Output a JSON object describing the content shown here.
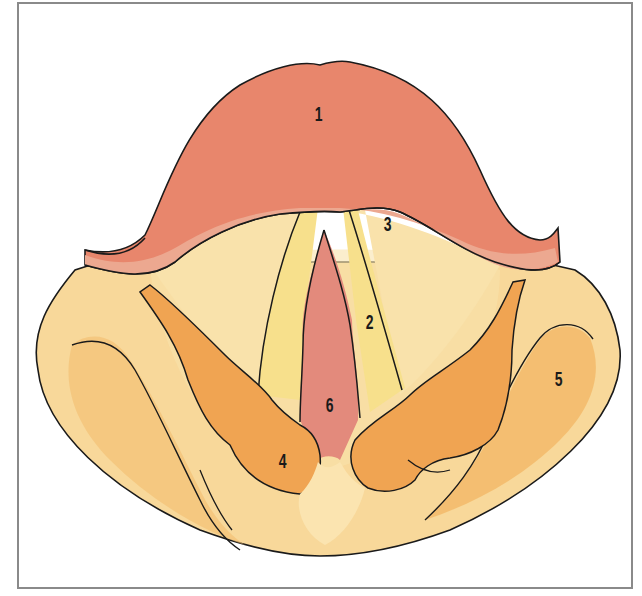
{
  "figure": {
    "labels": [
      {
        "id": "1",
        "text": "1",
        "x": 313,
        "y": 104
      },
      {
        "id": "2",
        "text": "2",
        "x": 364,
        "y": 312
      },
      {
        "id": "3",
        "text": "3",
        "x": 382,
        "y": 214
      },
      {
        "id": "4",
        "text": "4",
        "x": 277,
        "y": 451
      },
      {
        "id": "5",
        "text": "5",
        "x": 553,
        "y": 369
      },
      {
        "id": "6",
        "text": "6",
        "x": 324,
        "y": 395
      }
    ],
    "colors": {
      "epiglottis": "#e8866c",
      "epiglottis_edge": "#eca890",
      "vocal_cord": "#f7e08c",
      "vestibular_fold": "#f9e2ab",
      "base_tissue": "#f8d89a",
      "arytenoid": "#f0a452",
      "piriform": "#f2bc6c",
      "glottis": "#e38a7c",
      "outline": "#1a1a1a",
      "frame_border": "#8a8a8a"
    }
  }
}
